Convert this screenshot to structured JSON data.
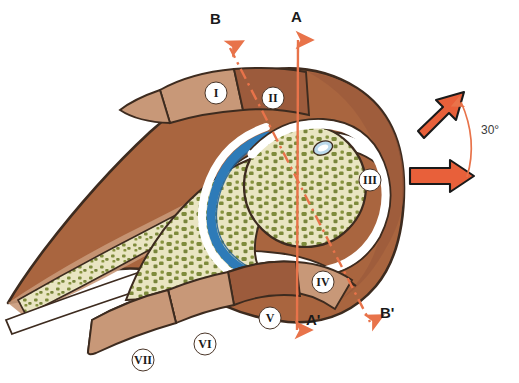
{
  "figure": {
    "type": "anatomical-cross-section",
    "background_color": "#ffffff"
  },
  "axes": [
    {
      "id": "A",
      "label_start": "A",
      "label_end": "A'",
      "style": "solid",
      "color": "#E8734A",
      "start": {
        "x": 298,
        "y": 36
      },
      "end": {
        "x": 297,
        "y": 334
      },
      "arrowheads": "both"
    },
    {
      "id": "B",
      "label_start": "B",
      "label_end": "B'",
      "style": "dash-dot",
      "color": "#E8734A",
      "start": {
        "x": 228,
        "y": 44
      },
      "end": {
        "x": 372,
        "y": 326
      },
      "arrowheads": "both"
    }
  ],
  "annotations": {
    "angle_label": "30°",
    "angle_value": 30,
    "angle_units": "degrees",
    "angle_arc_color": "#E8734A"
  },
  "direction_arrows": [
    {
      "name": "upper-block-arrow",
      "label": "",
      "color": "#E8603A",
      "angle_deg": -35
    },
    {
      "name": "lower-block-arrow",
      "label": "",
      "color": "#E8603A",
      "angle_deg": 0
    }
  ],
  "regions": [
    {
      "id": "I",
      "label": "I",
      "cx": 216,
      "cy": 93,
      "fill": "#C89878"
    },
    {
      "id": "II",
      "label": "II",
      "cx": 273,
      "cy": 98,
      "fill": "#9C5B3C"
    },
    {
      "id": "III",
      "label": "III",
      "cx": 370,
      "cy": 180,
      "fill": "#A9653F"
    },
    {
      "id": "IV",
      "label": "IV",
      "cx": 323,
      "cy": 282,
      "fill": "#C89878"
    },
    {
      "id": "V",
      "label": "V",
      "cx": 270,
      "cy": 318,
      "fill": "#9C5B3C"
    },
    {
      "id": "VI",
      "label": "VI",
      "cx": 205,
      "cy": 344,
      "fill": "#C89878"
    },
    {
      "id": "VII",
      "label": "VII",
      "cx": 143,
      "cy": 360,
      "fill": "#C89878"
    }
  ],
  "palette": {
    "soft_tissue_mid": "#A9653F",
    "soft_tissue_dark": "#8B4A2F",
    "soft_tissue_light": "#C89878",
    "bone_marrow_cream": "#E8E4C0",
    "trabecula_olive": "#7E8B3C",
    "cartilage_blue": "#2E7BB8",
    "cartilage_blue_light": "#BBD9EC",
    "capsule_white": "#FFFFFF",
    "outline_brown": "#3D2B1F",
    "arrow_orange": "#E8603A",
    "axis_salmon": "#E8734A",
    "text_black": "#1A1A1A"
  },
  "structures": [
    {
      "name": "femoral-head",
      "description": "rounded trabecular bone mass"
    },
    {
      "name": "acetabulum",
      "description": "trabecular bone socket"
    },
    {
      "name": "articular-cartilage",
      "description": "blue arc between head and socket"
    },
    {
      "name": "acetabular-labrum",
      "description": "small light blue oval"
    },
    {
      "name": "joint-capsule",
      "description": "white band surrounding joint"
    }
  ]
}
